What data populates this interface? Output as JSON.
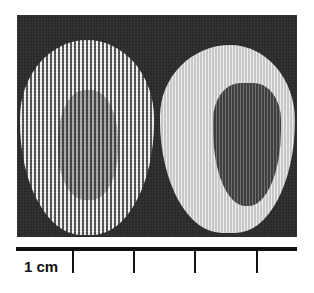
{
  "figure": {
    "left_specimen": "open knitted mesh patch",
    "right_specimen": "mesh patch with white coating and dark central region"
  },
  "scale_bar": {
    "label": "1 cm",
    "tick_count": 4
  }
}
